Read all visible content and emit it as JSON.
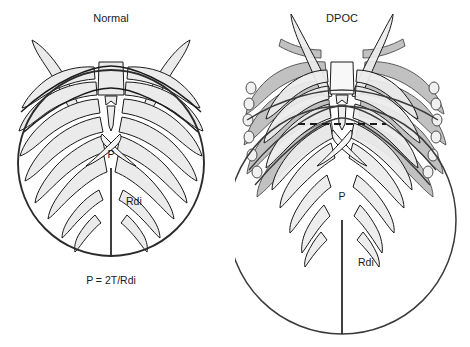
{
  "figure": {
    "kind": "medical-diagram",
    "background_color": "#ffffff",
    "outline_color": "#1a1a1a",
    "rib_fill_light": "#ebebeb",
    "rib_fill_mid": "#d4d4d4",
    "rib_fill_dark": "#a8a8a8",
    "circle_stroke": "#333333"
  },
  "panels": [
    {
      "id": "normal",
      "title": "Normal",
      "title_x": 111,
      "title_y": 22,
      "pressure_label": "P",
      "pressure_label_x": 111,
      "pressure_label_y": 158,
      "radius_label": "Rdi",
      "radius_label_x": 126,
      "radius_label_y": 205,
      "formula": "P = 2T/Rdi",
      "formula_x": 111,
      "formula_y": 284,
      "circle": {
        "cx": 111,
        "cy": 163,
        "r": 93
      },
      "radius_line": {
        "x1": 111,
        "y1": 168,
        "x2": 111,
        "y2": 256
      },
      "has_dashed_diaphragm": false,
      "has_hyperinflated_overlay": false
    },
    {
      "id": "dpoc",
      "title": "DPOC",
      "title_x": 107,
      "title_y": 22,
      "pressure_label": "P",
      "pressure_label_x": 107,
      "pressure_label_y": 200,
      "radius_label": "Rdi",
      "radius_label_x": 123,
      "radius_label_y": 266,
      "formula": "",
      "formula_x": 107,
      "formula_y": 0,
      "circle": {
        "cx": 107,
        "cy": 220,
        "r": 114
      },
      "radius_line": {
        "x1": 107,
        "y1": 220,
        "x2": 107,
        "y2": 334
      },
      "has_dashed_diaphragm": true,
      "has_hyperinflated_overlay": true
    }
  ],
  "annotations": {
    "pressure_symbol": "P",
    "radius_symbol": "Rdi",
    "tension_symbol": "T",
    "laplace_law": "P = 2T/Rdi"
  }
}
